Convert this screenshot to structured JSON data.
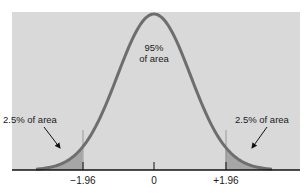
{
  "chart_data": {
    "type": "area",
    "title": "",
    "xlabel": "",
    "ylabel": "",
    "x_ticks": [
      "-1.96",
      "0",
      "+1.96"
    ],
    "x_tick_values": [
      -1.96,
      0,
      1.96
    ],
    "xlim": [
      -3.2,
      3.2
    ],
    "grid": false,
    "legend": null,
    "curve": "normal pdf, mean 0, sd 1",
    "regions": [
      {
        "name": "left-tail",
        "from": -3.2,
        "to": -1.96,
        "area_pct": 2.5,
        "shaded": true
      },
      {
        "name": "center",
        "from": -1.96,
        "to": 1.96,
        "area_pct": 95,
        "shaded": false
      },
      {
        "name": "right-tail",
        "from": 1.96,
        "to": 3.2,
        "area_pct": 2.5,
        "shaded": true
      }
    ],
    "annotations": [
      {
        "text": "95%\nof area",
        "target": "center"
      },
      {
        "text": "2.5% of area",
        "target": "left-tail",
        "arrow": true
      },
      {
        "text": "2.5% of area",
        "target": "right-tail",
        "arrow": true
      }
    ]
  },
  "labels": {
    "center_line1": "95%",
    "center_line2": "of area",
    "left_tail": "2.5% of area",
    "right_tail": "2.5% of area"
  },
  "ticks": {
    "left": "−1.96",
    "center": "0",
    "right": "+1.96"
  },
  "colors": {
    "panel": "#d9d9d9",
    "curve": "#6e6e6e",
    "tail_fill": "#a6a6a6",
    "axis": "#111111",
    "text": "#1a1a1a"
  }
}
